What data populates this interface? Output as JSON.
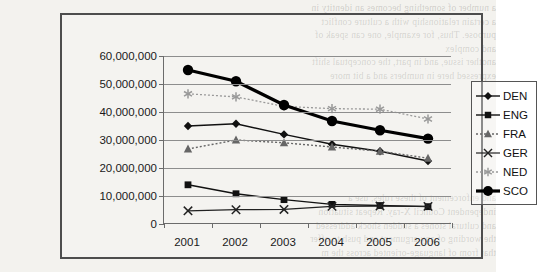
{
  "figure": {
    "has_title": false,
    "frame_color": "#4d4d4d"
  },
  "background_text": {
    "lines": [
      "a number of something becomes an identity in",
      "a certain relationship with a culture conflict",
      "purpose. Thus, for example, one can speak of",
      "and complex",
      "another issue, and in part, the conceptual shift",
      "expressed here in numbers and a bit more",
      "",
      "",
      "",
      "",
      "",
      "",
      "",
      "",
      "and enforcement of these rules, use a",
      "independent Council X-ray. Repeat situation",
      "and cultural stones a sudden shock addressed",
      "the wording of any argument and push to offer",
      "that from of language-oriented across the m"
    ]
  },
  "chart_data": {
    "type": "line",
    "title": "",
    "xlabel": "",
    "ylabel": "",
    "categories": [
      "2001",
      "2002",
      "2003",
      "2004",
      "2005",
      "2006"
    ],
    "ylim": [
      0,
      60000000
    ],
    "ytick_values": [
      0,
      10000000,
      20000000,
      30000000,
      40000000,
      50000000,
      60000000
    ],
    "ytick_labels": [
      "0",
      "10,000,000",
      "20,000,000",
      "30,000,000",
      "40,000,000",
      "50,000,000",
      "60,000,000"
    ],
    "grid": true,
    "legend_position": "right",
    "series": [
      {
        "name": "DEN",
        "values": [
          35000000,
          35800000,
          32000000,
          28500000,
          26000000,
          22500000
        ],
        "color": "#111111",
        "marker": "diamond",
        "line_style": "solid",
        "line_width": 1.4
      },
      {
        "name": "ENG",
        "values": [
          14000000,
          10800000,
          8700000,
          7000000,
          6600000,
          6200000
        ],
        "color": "#111111",
        "marker": "square",
        "line_style": "solid",
        "line_width": 1.4
      },
      {
        "name": "FRA",
        "values": [
          26800000,
          30000000,
          29000000,
          27500000,
          26000000,
          23500000
        ],
        "color": "#666666",
        "marker": "triangle",
        "line_style": "dotted",
        "line_width": 1.4
      },
      {
        "name": "GER",
        "values": [
          4700000,
          5100000,
          5200000,
          6300000,
          6400000,
          6300000
        ],
        "color": "#222222",
        "marker": "cross",
        "line_style": "solid",
        "line_width": 1.2
      },
      {
        "name": "NED",
        "values": [
          46500000,
          45400000,
          42000000,
          41200000,
          41000000,
          37500000
        ],
        "color": "#999999",
        "marker": "star",
        "line_style": "dotted",
        "line_width": 1.3
      },
      {
        "name": "SCO",
        "values": [
          55000000,
          51000000,
          42500000,
          36800000,
          33500000,
          30500000
        ],
        "color": "#000000",
        "marker": "circle",
        "line_style": "solid",
        "line_width": 3.2
      }
    ]
  }
}
